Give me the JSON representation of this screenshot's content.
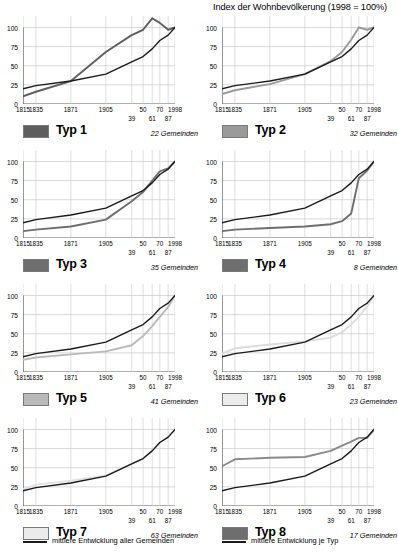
{
  "chart_title": "Index der Wohnbevölkerung (1998 = 100%)",
  "axis": {
    "y_ticks": [
      "0",
      "25",
      "50",
      "75",
      "100"
    ],
    "x_labels_row1": [
      "1815",
      "1835",
      "1871",
      "1905",
      "50",
      "70",
      "1998"
    ],
    "x_labels_row2": [
      "39",
      "61",
      "87"
    ]
  },
  "colors": {
    "all_communes_line": "#1a1a1a",
    "grid": "#c8c8c8",
    "axis": "#4d4d4d",
    "typ1": "#5e5e5e",
    "typ2": "#8c8c8c",
    "typ3": "#6e6e6e",
    "typ4": "#6e6e6e",
    "typ5": "#b5b5b5",
    "typ6": "#dcdcdc",
    "typ7": "#e2e2e2",
    "typ8": "#6e6e6e"
  },
  "legend": {
    "all_communes": "mittlere Entwicklung aller Gemeinden",
    "per_type": "mittlere Entwicklung je Typ"
  },
  "panels": [
    {
      "typ_label": "Typ 1",
      "gemeinden": "22 Gemeinden",
      "swatch_color": "#5e5e5e"
    },
    {
      "typ_label": "Typ 2",
      "gemeinden": "32 Gemeinden",
      "swatch_color": "#9a9a9a"
    },
    {
      "typ_label": "Typ 3",
      "gemeinden": "35 Gemeinden",
      "swatch_color": "#6e6e6e"
    },
    {
      "typ_label": "Typ 4",
      "gemeinden": "8 Gemeinden",
      "swatch_color": "#6e6e6e"
    },
    {
      "typ_label": "Typ 5",
      "gemeinden": "41 Gemeinden",
      "swatch_color": "#b9b9b9"
    },
    {
      "typ_label": "Typ 6",
      "gemeinden": "23 Gemeinden",
      "swatch_color": "#ececec"
    },
    {
      "typ_label": "Typ 7",
      "gemeinden": "63 Gemeinden",
      "swatch_color": "#ebebeb"
    },
    {
      "typ_label": "Typ 8",
      "gemeinden": "17 Gemeinden",
      "swatch_color": "#6e6e6e"
    }
  ],
  "chart_data": {
    "type": "line",
    "title": "Index der Wohnbevölkerung (1998 = 100%)",
    "xlabel": "",
    "ylabel": "Index (1998 = 100%)",
    "ylim": [
      0,
      115
    ],
    "grid": true,
    "legend_position": "bottom",
    "x": [
      1815,
      1835,
      1871,
      1905,
      1939,
      1950,
      1961,
      1970,
      1987,
      1998
    ],
    "x_tick_labels": [
      "1815",
      "1835",
      "1871",
      "1905",
      "39",
      "50",
      "61",
      "70",
      "87",
      "1998"
    ],
    "shared_series": {
      "name": "mittlere Entwicklung aller Gemeinden",
      "color": "#1a1a1a",
      "values": [
        20,
        24,
        30,
        39,
        55,
        62,
        72,
        83,
        90,
        100
      ]
    },
    "panels": [
      {
        "panel": "Typ 1",
        "communes": 22,
        "series": {
          "name": "mittlere Entwicklung je Typ",
          "color": "#5e5e5e",
          "values": [
            10,
            16,
            30,
            68,
            90,
            97,
            112,
            106,
            97,
            100
          ]
        }
      },
      {
        "panel": "Typ 2",
        "communes": 32,
        "series": {
          "name": "mittlere Entwicklung je Typ",
          "color": "#9a9a9a",
          "values": [
            13,
            18,
            26,
            39,
            56,
            68,
            84,
            100,
            97,
            100
          ]
        }
      },
      {
        "panel": "Typ 3",
        "communes": 35,
        "series": {
          "name": "mittlere Entwicklung je Typ",
          "color": "#6e6e6e",
          "values": [
            9,
            11,
            15,
            24,
            48,
            60,
            75,
            87,
            91,
            100
          ]
        }
      },
      {
        "panel": "Typ 4",
        "communes": 8,
        "series": {
          "name": "mittlere Entwicklung je Typ",
          "color": "#6e6e6e",
          "values": [
            9,
            11,
            13,
            15,
            18,
            22,
            32,
            78,
            88,
            100
          ]
        }
      },
      {
        "panel": "Typ 5",
        "communes": 41,
        "series": {
          "name": "mittlere Entwicklung je Typ",
          "color": "#b9b9b9",
          "values": [
            16,
            19,
            23,
            27,
            35,
            47,
            60,
            72,
            85,
            100
          ]
        }
      },
      {
        "panel": "Typ 6",
        "communes": 23,
        "series": {
          "name": "mittlere Entwicklung je Typ",
          "color": "#dcdcdc",
          "values": [
            24,
            31,
            36,
            40,
            45,
            52,
            62,
            72,
            86,
            100
          ]
        }
      },
      {
        "panel": "Typ 7",
        "communes": 63,
        "series": {
          "name": "mittlere Entwicklung je Typ",
          "color": "#e2e2e2",
          "values": [
            22,
            28,
            33,
            40,
            55,
            62,
            72,
            83,
            90,
            100
          ]
        }
      },
      {
        "panel": "Typ 8",
        "communes": 17,
        "series": {
          "name": "mittlere Entwicklung je Typ",
          "color": "#8a8a8a",
          "values": [
            52,
            61,
            63,
            64,
            72,
            79,
            84,
            89,
            89,
            100
          ]
        }
      }
    ]
  }
}
